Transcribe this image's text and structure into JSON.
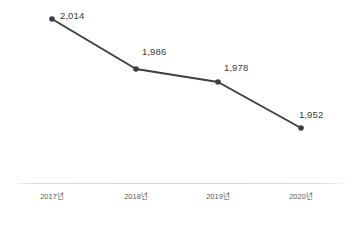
{
  "chart_data": {
    "type": "line",
    "title": "",
    "subtitle": "",
    "xlabel": "",
    "ylabel": "",
    "categories": [
      "2017년",
      "2018년",
      "2019년",
      "2020년"
    ],
    "values": [
      2014,
      1986,
      1978,
      1952
    ],
    "point_labels": [
      "2,014",
      "1,986",
      "1,978",
      "1,952"
    ],
    "ylim": [
      1940,
      2020
    ],
    "grid": false,
    "legend": null,
    "legend_position": "none",
    "series": [
      {
        "name": "",
        "values": [
          2014,
          1986,
          1978,
          1952
        ],
        "color": "#404040",
        "marker": "circle"
      }
    ],
    "points": [
      {
        "category": "2017년",
        "value": 2014,
        "label": "2,014",
        "cx": 52,
        "cy": 19,
        "label_x": 60,
        "label_y": 11
      },
      {
        "category": "2018년",
        "value": 1986,
        "label": "1,986",
        "cx": 136,
        "cy": 69,
        "label_x": 142,
        "label_y": 47
      },
      {
        "category": "2019년",
        "value": 1978,
        "label": "1,978",
        "cx": 218,
        "cy": 82,
        "label_x": 224,
        "label_y": 63
      },
      {
        "category": "2020년",
        "value": 1952,
        "label": "1,952",
        "cx": 301,
        "cy": 128,
        "label_x": 299,
        "label_y": 110
      }
    ],
    "ticks": [
      {
        "label": "2017년",
        "x": 52
      },
      {
        "label": "2018년",
        "x": 136
      },
      {
        "label": "2019년",
        "x": 218
      },
      {
        "label": "2020년",
        "x": 301
      }
    ],
    "axis_y": 183,
    "tick_label_y": 193
  },
  "colors": {
    "line": "#404040",
    "marker": "#3d3d3d",
    "data_label_text": "#3b3b3b",
    "tick_label_text": "#5a5a5a",
    "axis": "#d6d6d6",
    "background": "#ffffff"
  }
}
